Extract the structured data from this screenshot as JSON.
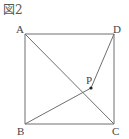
{
  "figure": {
    "title": "図2",
    "points": {
      "A": {
        "label": "A",
        "x": 25,
        "y": 34
      },
      "B": {
        "label": "B",
        "x": 25,
        "y": 124
      },
      "C": {
        "label": "C",
        "x": 114,
        "y": 124
      },
      "D": {
        "label": "D",
        "x": 114,
        "y": 34
      },
      "P": {
        "label": "P",
        "x": 91,
        "y": 88
      }
    },
    "segments": [
      "AB",
      "BC",
      "CD",
      "DA",
      "AC",
      "BP",
      "DP"
    ],
    "line_color": "#6e6e6e",
    "point_color": "#222222"
  }
}
